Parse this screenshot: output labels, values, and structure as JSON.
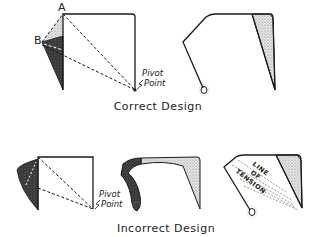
{
  "captions": {
    "correct": "Correct Design",
    "incorrect": "Incorrect Design"
  },
  "labels": {
    "point_a": "A",
    "point_b": "B",
    "pivot_line1": "Pivot",
    "pivot_line2": "Point",
    "tension_1": "LINE",
    "tension_2": "OF",
    "tension_3": "TENSION"
  },
  "colors": {
    "stroke": "#1a1a1a",
    "dark_fill": "#2a2a2a",
    "light_fill": "#bdbdbd"
  }
}
